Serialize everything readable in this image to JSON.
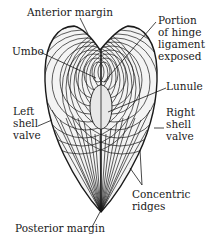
{
  "diagram": {
    "labels": {
      "anterior_margin": "Anterior margin",
      "umbo": "Umbo",
      "hinge_ligament": [
        "Portion",
        "of hinge",
        "ligament",
        "exposed"
      ],
      "lunule": "Lunule",
      "left_valve": [
        "Left",
        "shell",
        "valve"
      ],
      "right_valve": [
        "Right",
        "shell",
        "valve"
      ],
      "concentric_ridges": [
        "Concentric",
        "ridges"
      ],
      "posterior_margin": "Posterior margin"
    },
    "colors": {
      "ink": "#1a1a1a",
      "paper": "#ffffff",
      "lunule_fill": "#e8e8e8"
    }
  }
}
